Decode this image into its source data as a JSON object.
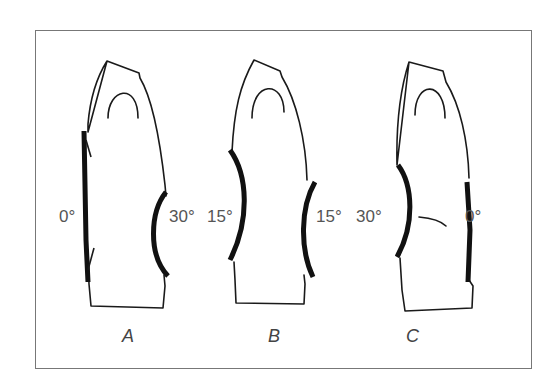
{
  "figure": {
    "panels": [
      {
        "caption": "A",
        "left_angle": "0°",
        "right_angle": "30°"
      },
      {
        "caption": "B",
        "left_angle": "15°",
        "right_angle": "15°"
      },
      {
        "caption": "C",
        "left_angle": "30°",
        "right_angle": "0°"
      }
    ]
  }
}
